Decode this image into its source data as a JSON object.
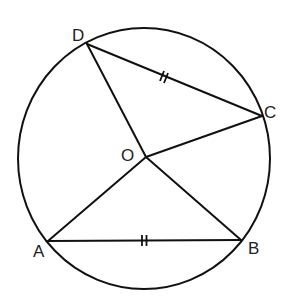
{
  "diagram": {
    "type": "circle-geometry",
    "circle": {
      "center_label": "O",
      "cx": 144,
      "cy": 158.5,
      "rx": 126,
      "ry": 130.5
    },
    "points": {
      "A": {
        "label": "A",
        "x": 48,
        "y": 241
      },
      "B": {
        "label": "B",
        "x": 241,
        "y": 240
      },
      "C": {
        "label": "C",
        "x": 262,
        "y": 116
      },
      "D": {
        "label": "D",
        "x": 87,
        "y": 44
      },
      "O": {
        "label": "O",
        "x": 146,
        "y": 157
      }
    },
    "segments": [
      "DC",
      "AB",
      "OA",
      "OB",
      "OC",
      "OD"
    ],
    "equal_marks": {
      "segments": [
        "DC",
        "AB"
      ],
      "mark": "double-tick"
    },
    "colors": {
      "line": "#111111",
      "background": "#ffffff"
    }
  }
}
